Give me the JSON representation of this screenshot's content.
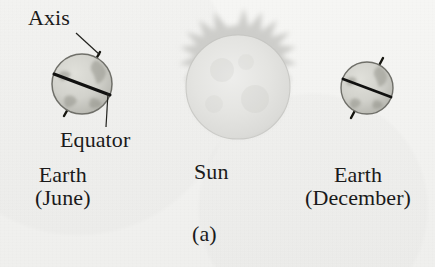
{
  "figure": {
    "caption": "(a)",
    "background_color": "#f2f2f0",
    "ink_color": "#1a1a1a"
  },
  "labels": {
    "axis": "Axis",
    "equator": "Equator",
    "sun": "Sun",
    "earth_june_line1": "Earth",
    "earth_june_line2": "(June)",
    "earth_december_line1": "Earth",
    "earth_december_line2": "(December)"
  },
  "objects": {
    "sun": {
      "name": "Sun",
      "center_x": 238,
      "center_y": 87,
      "radius": 52,
      "body_color": "#e2e2e0",
      "corona_color": "#cfcfcd",
      "has_corona_spikes": true
    },
    "earth_june": {
      "name": "Earth (June)",
      "center_x": 82,
      "center_y": 84,
      "radius": 30,
      "axis_tilt_degrees": 23.5,
      "axis_tilt_direction": "right",
      "body_color": "#d4d4cf",
      "outline_color": "#6d6d68",
      "equator_color": "#141414"
    },
    "earth_december": {
      "name": "Earth (December)",
      "center_x": 367,
      "center_y": 88,
      "radius": 26,
      "axis_tilt_degrees": 23.5,
      "axis_tilt_direction": "right",
      "body_color": "#d4d4cf",
      "outline_color": "#6d6d68",
      "equator_color": "#141414"
    }
  },
  "leader_lines": {
    "axis_leader": {
      "from_label": "Axis",
      "to_object": "earth-june-north-pole",
      "x1": 76,
      "y1": 33,
      "x2": 100,
      "y2": 56
    },
    "equator_leader": {
      "from_label": "Equator",
      "to_object": "earth-june-equator-line",
      "x1": 106,
      "y1": 128,
      "x2": 108,
      "y2": 94
    }
  }
}
